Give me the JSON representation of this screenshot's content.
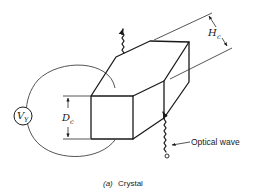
{
  "figure": {
    "caption_prefix": "(a)",
    "caption_text": "Crystal"
  },
  "labels": {
    "voltage_symbol": "V",
    "voltage_subscript": "Y",
    "thickness_symbol": "D",
    "thickness_subscript": "c",
    "height_symbol": "H",
    "height_subscript": "c",
    "optical_wave": "Optical wave"
  },
  "colors": {
    "ink": "#1a1a1a",
    "background": "#ffffff"
  }
}
